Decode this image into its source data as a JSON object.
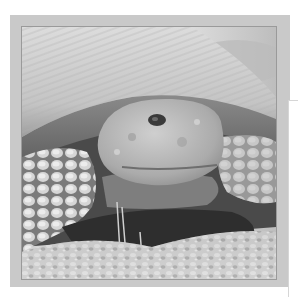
{
  "image": {
    "subject": "desert tortoise",
    "style": "grayscale photograph",
    "alt": "Close-up grayscale photograph of a desert tortoise with its head emerging from its shell, resting on rocky gravel ground"
  },
  "frame": {
    "color": "#c9c9c9",
    "background": "#ffffff"
  },
  "palette": {
    "shell_light": "#d8d8d8",
    "shell_shadow": "#6a6a6a",
    "head": "#b4b4b4",
    "scales": "#d0d0d0",
    "shadow": "#2e2e2e",
    "ground": "#cfcfcf"
  }
}
